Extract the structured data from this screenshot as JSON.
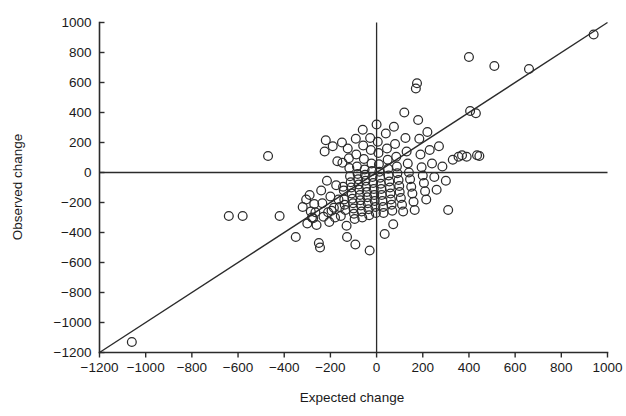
{
  "chart_data": {
    "type": "scatter",
    "title": "",
    "subtitle": "",
    "xlabel": "Expected change",
    "ylabel": "Observed change",
    "xlim": [
      -1200,
      1000
    ],
    "ylim": [
      -1200,
      1000
    ],
    "xticks": [
      -1200,
      -1000,
      -800,
      -600,
      -400,
      -200,
      0,
      200,
      400,
      600,
      800,
      1000
    ],
    "xticklabels": [
      "−1200",
      "−1000",
      "−800",
      "−600",
      "−400",
      "−200",
      "0",
      "200",
      "400",
      "600",
      "800",
      "1000"
    ],
    "yticks": [
      -1200,
      -1000,
      -800,
      -600,
      -400,
      -200,
      0,
      200,
      400,
      600,
      800,
      1000
    ],
    "yticklabels": [
      "−1200",
      "−1000",
      "−800",
      "−600",
      "−400",
      "−200",
      "0",
      "200",
      "400",
      "600",
      "800",
      "1000"
    ],
    "grid": false,
    "legend": null,
    "marker": {
      "shape": "open-circle",
      "radius_px": 4.4,
      "edge_color": "#2b2b2b",
      "fill": "none"
    },
    "reference_lines": [
      {
        "name": "horizontal-zero-line",
        "orientation": "horizontal",
        "value": 0,
        "from": -1200,
        "to": 1000
      },
      {
        "name": "vertical-zero-line",
        "orientation": "vertical",
        "value": 0,
        "from": -1200,
        "to": 1000
      }
    ],
    "identity_line": {
      "name": "identity-line",
      "slope": 1,
      "intercept": 0,
      "x_from": -1200,
      "x_to": 1000
    },
    "series": [
      {
        "name": "observations",
        "points": [
          [
            -1060,
            -1130
          ],
          [
            -640,
            -290
          ],
          [
            -580,
            -290
          ],
          [
            -470,
            110
          ],
          [
            -420,
            -290
          ],
          [
            -350,
            -430
          ],
          [
            -320,
            -230
          ],
          [
            -305,
            -180
          ],
          [
            -300,
            -340
          ],
          [
            -290,
            -150
          ],
          [
            -285,
            -260
          ],
          [
            -280,
            -300
          ],
          [
            -275,
            -305
          ],
          [
            -270,
            -210
          ],
          [
            -265,
            -265
          ],
          [
            -260,
            -350
          ],
          [
            -250,
            -470
          ],
          [
            -245,
            -500
          ],
          [
            -240,
            -120
          ],
          [
            -235,
            -205
          ],
          [
            -230,
            -295
          ],
          [
            -225,
            140
          ],
          [
            -220,
            215
          ],
          [
            -215,
            -55
          ],
          [
            -210,
            -265
          ],
          [
            -205,
            -330
          ],
          [
            -200,
            -160
          ],
          [
            -195,
            -255
          ],
          [
            -190,
            175
          ],
          [
            -185,
            -235
          ],
          [
            -180,
            -300
          ],
          [
            -175,
            -85
          ],
          [
            -170,
            75
          ],
          [
            -165,
            -180
          ],
          [
            -160,
            -230
          ],
          [
            -155,
            -290
          ],
          [
            -150,
            200
          ],
          [
            -148,
            65
          ],
          [
            -145,
            -95
          ],
          [
            -142,
            -120
          ],
          [
            -140,
            -180
          ],
          [
            -138,
            -215
          ],
          [
            -135,
            -250
          ],
          [
            -130,
            -355
          ],
          [
            -128,
            -430
          ],
          [
            -125,
            160
          ],
          [
            -120,
            95
          ],
          [
            -118,
            30
          ],
          [
            -115,
            -25
          ],
          [
            -112,
            -65
          ],
          [
            -110,
            -100
          ],
          [
            -108,
            -140
          ],
          [
            -105,
            -175
          ],
          [
            -102,
            -205
          ],
          [
            -100,
            -240
          ],
          [
            -98,
            -275
          ],
          [
            -95,
            -310
          ],
          [
            -92,
            -480
          ],
          [
            -90,
            225
          ],
          [
            -88,
            120
          ],
          [
            -85,
            40
          ],
          [
            -82,
            -10
          ],
          [
            -80,
            -45
          ],
          [
            -78,
            -80
          ],
          [
            -75,
            -115
          ],
          [
            -72,
            -150
          ],
          [
            -70,
            -185
          ],
          [
            -68,
            -220
          ],
          [
            -65,
            -260
          ],
          [
            -62,
            -300
          ],
          [
            -60,
            285
          ],
          [
            -58,
            180
          ],
          [
            -55,
            90
          ],
          [
            -52,
            20
          ],
          [
            -50,
            -15
          ],
          [
            -48,
            -55
          ],
          [
            -45,
            -95
          ],
          [
            -42,
            -130
          ],
          [
            -40,
            -165
          ],
          [
            -38,
            -205
          ],
          [
            -35,
            -245
          ],
          [
            -32,
            -285
          ],
          [
            -30,
            -520
          ],
          [
            -28,
            230
          ],
          [
            -25,
            150
          ],
          [
            -22,
            60
          ],
          [
            -20,
            10
          ],
          [
            -18,
            -30
          ],
          [
            -15,
            -70
          ],
          [
            -12,
            -110
          ],
          [
            -10,
            -150
          ],
          [
            -8,
            -190
          ],
          [
            -5,
            -230
          ],
          [
            -3,
            -270
          ],
          [
            0,
            320
          ],
          [
            5,
            205
          ],
          [
            8,
            130
          ],
          [
            10,
            55
          ],
          [
            12,
            5
          ],
          [
            15,
            -35
          ],
          [
            18,
            -75
          ],
          [
            20,
            -110
          ],
          [
            22,
            -150
          ],
          [
            25,
            -190
          ],
          [
            28,
            -230
          ],
          [
            30,
            -270
          ],
          [
            35,
            -410
          ],
          [
            40,
            260
          ],
          [
            45,
            160
          ],
          [
            48,
            85
          ],
          [
            50,
            25
          ],
          [
            52,
            -20
          ],
          [
            55,
            -60
          ],
          [
            58,
            -100
          ],
          [
            60,
            -140
          ],
          [
            62,
            -180
          ],
          [
            65,
            -215
          ],
          [
            68,
            -255
          ],
          [
            72,
            -345
          ],
          [
            75,
            305
          ],
          [
            80,
            190
          ],
          [
            85,
            105
          ],
          [
            88,
            40
          ],
          [
            90,
            -5
          ],
          [
            95,
            -50
          ],
          [
            98,
            -90
          ],
          [
            100,
            -130
          ],
          [
            105,
            -170
          ],
          [
            110,
            -215
          ],
          [
            115,
            -260
          ],
          [
            120,
            400
          ],
          [
            125,
            230
          ],
          [
            130,
            140
          ],
          [
            135,
            60
          ],
          [
            140,
            0
          ],
          [
            145,
            -45
          ],
          [
            150,
            -95
          ],
          [
            155,
            -140
          ],
          [
            160,
            -195
          ],
          [
            165,
            -250
          ],
          [
            170,
            560
          ],
          [
            175,
            595
          ],
          [
            180,
            350
          ],
          [
            185,
            225
          ],
          [
            190,
            120
          ],
          [
            195,
            35
          ],
          [
            200,
            -20
          ],
          [
            205,
            -70
          ],
          [
            210,
            -125
          ],
          [
            215,
            -180
          ],
          [
            220,
            270
          ],
          [
            230,
            150
          ],
          [
            240,
            60
          ],
          [
            250,
            -30
          ],
          [
            260,
            -115
          ],
          [
            270,
            175
          ],
          [
            285,
            40
          ],
          [
            300,
            -55
          ],
          [
            310,
            -250
          ],
          [
            330,
            85
          ],
          [
            355,
            105
          ],
          [
            370,
            115
          ],
          [
            390,
            105
          ],
          [
            400,
            770
          ],
          [
            405,
            410
          ],
          [
            430,
            395
          ],
          [
            435,
            115
          ],
          [
            445,
            110
          ],
          [
            510,
            710
          ],
          [
            660,
            690
          ],
          [
            940,
            920
          ]
        ]
      }
    ]
  },
  "figure": {
    "background_color": "#ffffff",
    "line_color": "#2b2b2b"
  }
}
